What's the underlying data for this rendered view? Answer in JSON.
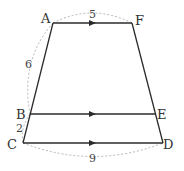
{
  "diagram": {
    "type": "trapezoid-parallel-lines",
    "colors": {
      "line": "#2b2b2b",
      "dashed": "#b5b5b5",
      "text": "#333333"
    },
    "points": {
      "A": {
        "label": "A",
        "x": 53,
        "y": 23,
        "lx": 45,
        "ly": 23
      },
      "F": {
        "label": "F",
        "x": 132,
        "y": 23,
        "lx": 140,
        "ly": 25
      },
      "B": {
        "label": "B",
        "x": 30,
        "y": 114,
        "lx": 18,
        "ly": 118
      },
      "E": {
        "label": "E",
        "x": 155,
        "y": 114,
        "lx": 160,
        "ly": 118
      },
      "C": {
        "label": "C",
        "x": 23,
        "y": 143,
        "lx": 9,
        "ly": 148
      },
      "D": {
        "label": "D",
        "x": 163,
        "y": 143,
        "lx": 166,
        "ly": 148
      }
    },
    "segments": [
      {
        "from": "A",
        "to": "F",
        "arrow": true
      },
      {
        "from": "B",
        "to": "E",
        "arrow": true
      },
      {
        "from": "C",
        "to": "D",
        "arrow": true
      },
      {
        "from": "A",
        "to": "C",
        "arrow": false
      },
      {
        "from": "F",
        "to": "D",
        "arrow": false
      }
    ],
    "measurements": {
      "AF": "5",
      "AB": "6",
      "BC": "2",
      "CD": "9"
    }
  }
}
